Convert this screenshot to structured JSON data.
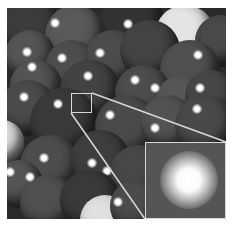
{
  "figure": {
    "colors": {
      "sphere_dark": "#4a4a4a",
      "sphere_mid": "#5e5e5e",
      "sphere_light": "#e8e8e8",
      "frame_line": "#d8d8d8",
      "background": "#ffffff"
    },
    "spheres": [
      {
        "x": 0,
        "y": -5,
        "r": 30,
        "c": "#3c3c3c",
        "hx": 0,
        "hy": 0
      },
      {
        "x": 45,
        "y": 5,
        "r": 30,
        "c": "#5a5a5a",
        "hx": 55,
        "hy": 23
      },
      {
        "x": 100,
        "y": -10,
        "r": 32,
        "c": "#333333",
        "hx": 0,
        "hy": 0
      },
      {
        "x": 155,
        "y": 5,
        "r": 30,
        "c": "#e4e4e4",
        "hx": 0,
        "hy": 0
      },
      {
        "x": 195,
        "y": 15,
        "r": 26,
        "c": "#4a4a4a",
        "hx": 0,
        "hy": 0
      },
      {
        "x": 5,
        "y": 30,
        "r": 25,
        "c": "#555555",
        "hx": 27,
        "hy": 52
      },
      {
        "x": 45,
        "y": 40,
        "r": 27,
        "c": "#4e4e4e",
        "hx": 62,
        "hy": 58
      },
      {
        "x": 85,
        "y": 30,
        "r": 28,
        "c": "#4c4c4c",
        "hx": 100,
        "hy": 53
      },
      {
        "x": 120,
        "y": 20,
        "r": 30,
        "c": "#444444",
        "hx": 128,
        "hy": 24
      },
      {
        "x": 160,
        "y": 40,
        "r": 30,
        "c": "#505050",
        "hx": 198,
        "hy": 55
      },
      {
        "x": 10,
        "y": 60,
        "r": 26,
        "c": "#545454",
        "hx": 32,
        "hy": 67
      },
      {
        "x": 60,
        "y": 60,
        "r": 30,
        "c": "#434343",
        "hx": 88,
        "hy": 76
      },
      {
        "x": 115,
        "y": 65,
        "r": 28,
        "c": "#4d4d4d",
        "hx": 135,
        "hy": 80
      },
      {
        "x": 155,
        "y": 75,
        "r": 27,
        "c": "#575757",
        "hx": 155,
        "hy": 88
      },
      {
        "x": 185,
        "y": 70,
        "r": 26,
        "c": "#474747",
        "hx": 200,
        "hy": 88
      },
      {
        "x": 0,
        "y": 80,
        "r": 28,
        "c": "#4b4b4b",
        "hx": 24,
        "hy": 97
      },
      {
        "x": 30,
        "y": 88,
        "r": 34,
        "c": "#3a3a3a",
        "hx": 58,
        "hy": 104
      },
      {
        "x": 95,
        "y": 95,
        "r": 32,
        "c": "#4a4a4a",
        "hx": 110,
        "hy": 115
      },
      {
        "x": 140,
        "y": 95,
        "r": 28,
        "c": "#525252",
        "hx": 155,
        "hy": 128
      },
      {
        "x": 175,
        "y": 95,
        "r": 30,
        "c": "#494949",
        "hx": 197,
        "hy": 109
      },
      {
        "x": -20,
        "y": 120,
        "r": 22,
        "c": "#e6e6e6",
        "hx": 0,
        "hy": 0
      },
      {
        "x": 20,
        "y": 135,
        "r": 30,
        "c": "#4d4d4d",
        "hx": 44,
        "hy": 158
      },
      {
        "x": 70,
        "y": 130,
        "r": 30,
        "c": "#3e3e3e",
        "hx": 92,
        "hy": 163
      },
      {
        "x": 110,
        "y": 145,
        "r": 28,
        "c": "#484848",
        "hx": 107,
        "hy": 171
      },
      {
        "x": -5,
        "y": 160,
        "r": 24,
        "c": "#555555",
        "hx": 10,
        "hy": 172
      },
      {
        "x": 20,
        "y": 175,
        "r": 28,
        "c": "#505050",
        "hx": 30,
        "hy": 177
      },
      {
        "x": 60,
        "y": 170,
        "r": 30,
        "c": "#3a3a3a",
        "hx": 0,
        "hy": 0
      },
      {
        "x": 80,
        "y": 195,
        "r": 25,
        "c": "#e0e0e0",
        "hx": 0,
        "hy": 0
      },
      {
        "x": 110,
        "y": 180,
        "r": 26,
        "c": "#4c4c4c",
        "hx": 118,
        "hy": 202
      }
    ],
    "zoom_box": {
      "x": 71,
      "y": 93,
      "w": 21,
      "h": 20
    },
    "inset": {
      "x": 145,
      "y": 142,
      "w": 81,
      "h": 77
    },
    "connector_lines": [
      {
        "x1": 92,
        "y1": 93,
        "x2": 226,
        "y2": 142
      },
      {
        "x1": 71,
        "y1": 113,
        "x2": 145,
        "y2": 219
      }
    ]
  }
}
